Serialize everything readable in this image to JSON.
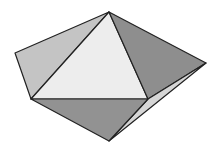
{
  "diagram": {
    "type": "polyhedron",
    "vertices": {
      "apex": [
        109,
        12
      ],
      "left": [
        15,
        53
      ],
      "right": [
        206,
        63
      ],
      "inner_left": [
        31,
        99
      ],
      "inner_right": [
        148,
        99
      ],
      "bottom": [
        109,
        141
      ]
    },
    "faces": [
      {
        "name": "left-face",
        "points": "109,12 15,53 31,99",
        "fill": "#c4c4c4"
      },
      {
        "name": "front-face",
        "points": "109,12 31,99 148,99",
        "fill": "#ededed"
      },
      {
        "name": "right-face",
        "points": "109,12 148,99 206,63",
        "fill": "#8e8e8e"
      },
      {
        "name": "bottom-right-sliver",
        "points": "148,99 206,63 109,141",
        "fill": "#d6d6d6"
      },
      {
        "name": "bottom-face",
        "points": "31,99 148,99 109,141",
        "fill": "#929292"
      }
    ],
    "stroke_color": "#222222"
  }
}
